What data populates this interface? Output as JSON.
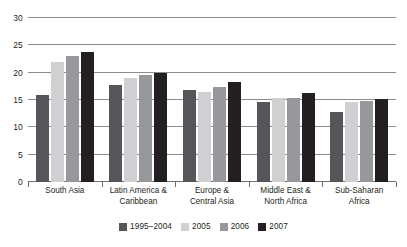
{
  "chart_data": {
    "type": "bar",
    "title": "",
    "subtitle": "",
    "xlabel": "",
    "ylabel": "",
    "ylim": [
      0,
      30
    ],
    "yticks": [
      0,
      5,
      10,
      15,
      20,
      25,
      30
    ],
    "ytick_labels": [
      "0",
      "5",
      "10",
      "15",
      "20",
      "25",
      "30"
    ],
    "grid": true,
    "legend_position": "bottom",
    "categories": [
      "South Asia",
      "Latin America & Caribbean",
      "Europe & Central Asia",
      "Middle East & North Africa",
      "Sub-Saharan Africa"
    ],
    "category_lines": [
      [
        "South Asia"
      ],
      [
        "Latin America &",
        "Caribbean"
      ],
      [
        "Europe &",
        "Central Asia"
      ],
      [
        "Middle East &",
        "North Africa"
      ],
      [
        "Sub-Saharan",
        "Africa"
      ]
    ],
    "series": [
      {
        "name": "1995–2004",
        "color": "#54565a",
        "values": [
          16.0,
          17.7,
          16.8,
          14.7,
          12.8
        ]
      },
      {
        "name": "2005",
        "color": "#cfd0d1",
        "values": [
          22.0,
          19.0,
          16.4,
          15.3,
          14.7
        ]
      },
      {
        "name": "2006",
        "color": "#96989b",
        "values": [
          23.0,
          19.6,
          17.3,
          15.3,
          14.8
        ]
      },
      {
        "name": "2007",
        "color": "#231f20",
        "values": [
          23.8,
          20.0,
          18.3,
          16.2,
          15.1
        ]
      }
    ]
  }
}
